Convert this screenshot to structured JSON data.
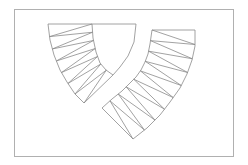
{
  "figure": {
    "colors": {
      "frame": "#b0b0b0",
      "mesh": "#8a8a8a",
      "background": "#ffffff"
    },
    "frame": {
      "x": 14,
      "y": 9,
      "w": 219,
      "h": 147
    },
    "left_strip": {
      "outer_arc": [
        [
          48,
          24
        ],
        [
          50,
          40
        ],
        [
          54,
          55
        ],
        [
          60,
          70
        ],
        [
          67,
          82
        ],
        [
          75,
          94
        ],
        [
          84,
          103
        ]
      ],
      "inner_arc": [
        [
          92,
          24
        ],
        [
          93,
          38
        ],
        [
          96,
          52
        ],
        [
          100,
          63
        ],
        [
          106,
          70
        ],
        [
          113,
          75
        ]
      ],
      "cap_arc": [
        [
          136,
          24
        ],
        [
          134,
          42
        ],
        [
          128,
          56
        ],
        [
          120,
          67
        ],
        [
          113,
          75
        ]
      ],
      "top_edge": [
        [
          48,
          24
        ],
        [
          136,
          24
        ]
      ],
      "bottom_edge": [
        [
          84,
          103
        ],
        [
          113,
          75
        ]
      ]
    },
    "right_strip": {
      "outer_arc": [
        [
          195,
          30
        ],
        [
          195,
          46
        ],
        [
          192,
          60
        ],
        [
          187,
          74
        ],
        [
          180,
          88
        ],
        [
          170,
          102
        ],
        [
          160,
          115
        ],
        [
          147,
          128
        ],
        [
          133,
          139
        ]
      ],
      "inner_arc": [
        [
          152,
          30
        ],
        [
          150,
          44
        ],
        [
          148,
          54
        ],
        [
          145,
          62
        ],
        [
          141,
          70
        ],
        [
          136,
          77
        ],
        [
          131,
          82
        ],
        [
          122,
          91
        ],
        [
          112,
          99
        ],
        [
          102,
          108
        ]
      ],
      "top_edge": [
        [
          152,
          30
        ],
        [
          195,
          30
        ]
      ],
      "bottom_edge": [
        [
          102,
          108
        ],
        [
          133,
          139
        ]
      ]
    }
  }
}
